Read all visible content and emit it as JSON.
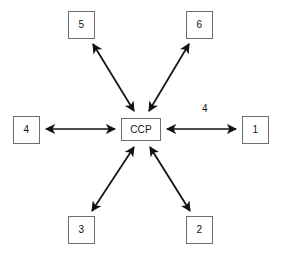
{
  "diagram": {
    "type": "hub-and-spoke",
    "center": {
      "id": "ccp",
      "label": "CCP",
      "shape": "rectangle"
    },
    "nodes": [
      {
        "id": "node-5",
        "label": "5",
        "shape": "square",
        "position": "top-left"
      },
      {
        "id": "node-6",
        "label": "6",
        "shape": "square",
        "position": "top-right"
      },
      {
        "id": "node-4",
        "label": "4",
        "shape": "square",
        "position": "left"
      },
      {
        "id": "node-1",
        "label": "1",
        "shape": "square",
        "position": "right"
      },
      {
        "id": "node-3",
        "label": "3",
        "shape": "square",
        "position": "bottom-left"
      },
      {
        "id": "node-2",
        "label": "2",
        "shape": "square",
        "position": "bottom-right"
      }
    ],
    "edges": [
      {
        "id": "edge-ccp-5",
        "from": "ccp",
        "to": "node-5",
        "arrow": "double",
        "label": ""
      },
      {
        "id": "edge-ccp-6",
        "from": "ccp",
        "to": "node-6",
        "arrow": "double",
        "label": ""
      },
      {
        "id": "edge-ccp-4",
        "from": "ccp",
        "to": "node-4",
        "arrow": "double",
        "label": ""
      },
      {
        "id": "edge-ccp-1",
        "from": "ccp",
        "to": "node-1",
        "arrow": "double",
        "label": "4"
      },
      {
        "id": "edge-ccp-3",
        "from": "ccp",
        "to": "node-3",
        "arrow": "double",
        "label": ""
      },
      {
        "id": "edge-ccp-2",
        "from": "ccp",
        "to": "node-2",
        "arrow": "double",
        "label": ""
      }
    ],
    "labels": {
      "right_edge_label": "4"
    },
    "colors": {
      "background": "#ffffff",
      "box_border": "#6e6e6e",
      "arrow": "#111111",
      "text": "#141414"
    }
  }
}
